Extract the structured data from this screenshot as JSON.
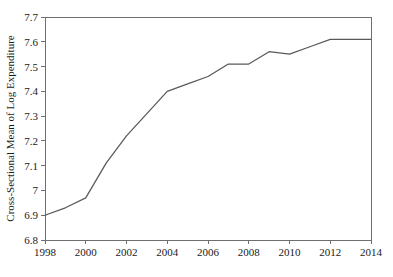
{
  "chart_data": {
    "type": "line",
    "title": "",
    "xlabel": "",
    "ylabel": "Cross-Sectional Mean of Log Expenditure",
    "xlim": [
      1998,
      2014
    ],
    "ylim": [
      6.8,
      7.7
    ],
    "grid": false,
    "legend": null,
    "x_ticks": [
      "1998",
      "2000",
      "2002",
      "2004",
      "2006",
      "2008",
      "2010",
      "2012",
      "2014"
    ],
    "y_ticks": [
      "6.8",
      "6.9",
      "7",
      "7.1",
      "7.2",
      "7.3",
      "7.4",
      "7.5",
      "7.6",
      "7.7"
    ],
    "x": [
      1998,
      1999,
      2000,
      2001,
      2002,
      2003,
      2004,
      2005,
      2006,
      2007,
      2008,
      2009,
      2010,
      2011,
      2012,
      2013,
      2014
    ],
    "values": [
      6.9,
      6.93,
      6.97,
      7.11,
      7.22,
      7.31,
      7.4,
      7.43,
      7.46,
      7.51,
      7.51,
      7.56,
      7.55,
      7.58,
      7.61,
      7.61,
      7.61
    ],
    "series": [
      {
        "name": "Cross-Sectional Mean of Log Expenditure",
        "color": "#595959",
        "values": [
          6.9,
          6.93,
          6.97,
          7.11,
          7.22,
          7.31,
          7.4,
          7.43,
          7.46,
          7.51,
          7.51,
          7.56,
          7.55,
          7.58,
          7.61,
          7.61,
          7.61
        ]
      }
    ]
  },
  "plot": {
    "left": 45,
    "right": 371,
    "top": 17,
    "bottom": 240,
    "axis_color": "#6f6f6f",
    "line_color": "#595959",
    "background": "#ffffff"
  }
}
